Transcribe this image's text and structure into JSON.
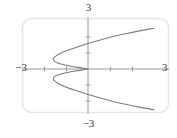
{
  "figure": {
    "kind": "graph-plot",
    "frame_color": "#e6e6e6",
    "axis_color": "#9a9a9a",
    "curve_color": "#7d7d7d",
    "label_color": "#3a3a3a",
    "background": "#ffffff"
  },
  "labels": {
    "top": "3",
    "bottom": "−3",
    "left": "−3",
    "right": "3"
  },
  "chart_data": {
    "type": "line",
    "title": "",
    "xlabel": "",
    "ylabel": "",
    "xlim": [
      -3,
      3
    ],
    "ylim": [
      -3,
      3
    ],
    "grid": false,
    "legend": null,
    "xticks": [
      -2,
      -1,
      1,
      2
    ],
    "yticks": [
      -2,
      -1,
      1,
      2
    ],
    "xtick_labels": [
      "",
      "",
      "",
      ""
    ],
    "ytick_labels": [
      "",
      "",
      "",
      ""
    ],
    "axis_end_labels": {
      "x_min": "−3",
      "x_max": "3",
      "y_min": "−3",
      "y_max": "3"
    },
    "series": [
      {
        "name": "curve",
        "description": "sideways cubic: x expressed as function of y, S-shaped, passes through origin with two turning points at left",
        "points": [
          [
            3.0,
            2.55
          ],
          [
            2.4,
            2.4
          ],
          [
            1.7,
            2.2
          ],
          [
            1.0,
            1.98
          ],
          [
            0.4,
            1.75
          ],
          [
            -0.1,
            1.55
          ],
          [
            -0.55,
            1.35
          ],
          [
            -0.95,
            1.15
          ],
          [
            -1.25,
            0.98
          ],
          [
            -1.45,
            0.82
          ],
          [
            -1.55,
            0.7
          ],
          [
            -1.58,
            0.6
          ],
          [
            -1.52,
            0.48
          ],
          [
            -1.38,
            0.38
          ],
          [
            -1.15,
            0.28
          ],
          [
            -0.88,
            0.2
          ],
          [
            -0.58,
            0.13
          ],
          [
            -0.3,
            0.07
          ],
          [
            0.0,
            0.0
          ],
          [
            -0.3,
            -0.07
          ],
          [
            -0.58,
            -0.13
          ],
          [
            -0.88,
            -0.2
          ],
          [
            -1.15,
            -0.28
          ],
          [
            -1.38,
            -0.38
          ],
          [
            -1.52,
            -0.48
          ],
          [
            -1.58,
            -0.6
          ],
          [
            -1.55,
            -0.7
          ],
          [
            -1.45,
            -0.82
          ],
          [
            -1.25,
            -0.98
          ],
          [
            -0.95,
            -1.15
          ],
          [
            -0.55,
            -1.35
          ],
          [
            -0.1,
            -1.55
          ],
          [
            0.4,
            -1.75
          ],
          [
            1.0,
            -1.98
          ],
          [
            1.7,
            -2.2
          ],
          [
            2.4,
            -2.4
          ],
          [
            3.0,
            -2.55
          ]
        ]
      }
    ]
  }
}
